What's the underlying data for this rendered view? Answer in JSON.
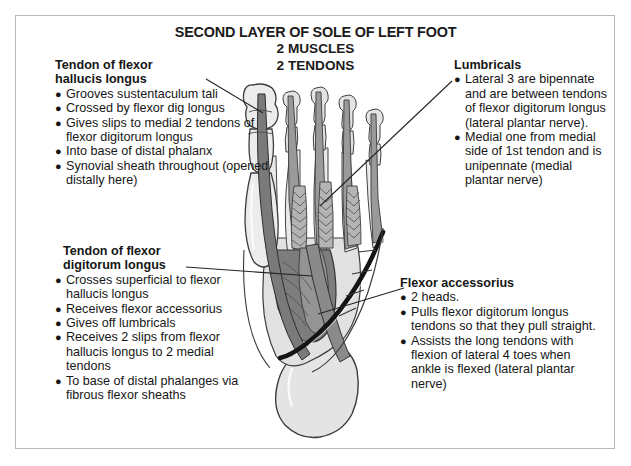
{
  "figure": {
    "title_main": "SECOND LAYER OF SOLE OF LEFT FOOT",
    "title_line2": "2 MUSCLES",
    "title_line3": "2 TENDONS"
  },
  "notes": {
    "flexor_hallucis_longus": {
      "heading_line1": "Tendon of flexor",
      "heading_line2": "hallucis longus",
      "items": [
        "Grooves sustentaculum tali",
        "Crossed by flexor dig longus",
        "Gives slips to medial 2 tendons of flexor digitorum longus",
        "Into base of distal phalanx",
        "Synovial sheath throughout (opened distally here)"
      ]
    },
    "flexor_digitorum_longus": {
      "heading_line1": "Tendon of flexor",
      "heading_line2": "digitorum longus",
      "items": [
        "Crosses superficial to flexor hallucis longus",
        "Receives flexor accessorius",
        "Gives off lumbricals",
        "Receives 2 slips from flexor hallucis longus to 2 medial tendons",
        "To base of distal phalanges via fibrous flexor sheaths"
      ]
    },
    "lumbricals": {
      "heading_line1": "Lumbricals",
      "items": [
        "Lateral 3 are bipennate and are between tendons of flexor digitorum longus (lateral plantar nerve).",
        "Medial one from medial side of 1st tendon and is unipennate (medial plantar nerve)"
      ]
    },
    "flexor_accessorius": {
      "heading_line1": "Flexor accessorius",
      "items": [
        "2 heads.",
        "Pulls flexor digitorum longus tendons so that they pull straight.",
        "Assists the long tendons with flexion of lateral 4 toes when ankle is flexed (lateral plantar nerve)"
      ]
    }
  },
  "bullet_glyph": "●",
  "colors": {
    "border": "#b9b9b9",
    "text": "#161616",
    "background": "#ffffff",
    "bone_light": "#e7e7e7",
    "bone_mid": "#d2d2d2",
    "tendon_gray": "#8d8d8d",
    "muscle_dark": "#6f6f6f",
    "tendon_black": "#1c1c1c",
    "outline": "#3a3a3a",
    "leader_line": "#2b2b2b"
  }
}
